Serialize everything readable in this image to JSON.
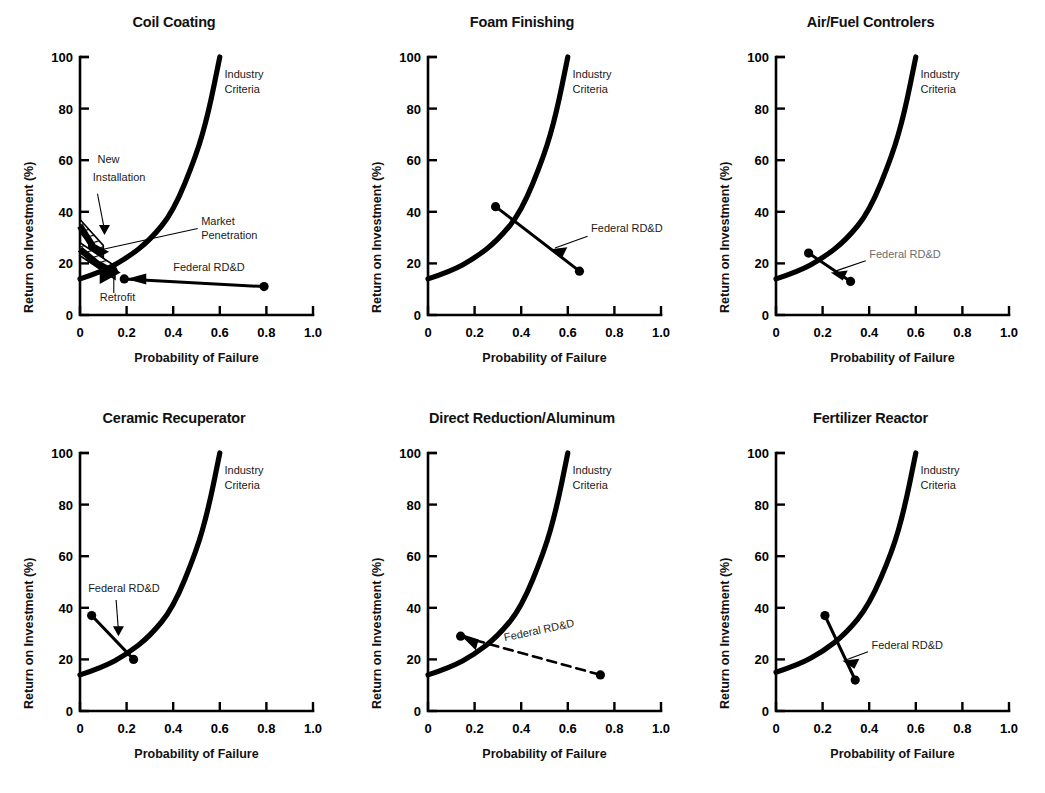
{
  "figure": {
    "axis_labels": {
      "y": "Return on Investment (%)",
      "x": "Probability of Failure"
    },
    "y_ticks": [
      "0",
      "20",
      "40",
      "60",
      "80",
      "100"
    ],
    "x_ticks": [
      "0",
      "0.2",
      "0.4",
      "0.6",
      "0.8",
      "1.0"
    ],
    "series_labels": {
      "industry": "Industry\nCriteria",
      "industry_line1": "Industry",
      "industry_line2": "Criteria",
      "federal": "Federal RD&D",
      "market_line1": "Market",
      "market_line2": "Penetration",
      "new_line1": "New",
      "new_line2": "Installation",
      "retrofit": "Retrofit"
    }
  },
  "chart_data": [
    {
      "type": "line",
      "title": "Coil Coating",
      "xlabel": "Probability of Failure",
      "ylabel": "Return on Investment (%)",
      "xlim": [
        0,
        1.0
      ],
      "ylim": [
        0,
        100
      ],
      "xticks": [
        0,
        0.2,
        0.4,
        0.6,
        0.8,
        1.0
      ],
      "yticks": [
        0,
        20,
        40,
        60,
        80,
        100
      ],
      "grid": false,
      "legend": "none",
      "series": [
        {
          "name": "Industry Criteria",
          "style": "solid-thick",
          "x": [
            0,
            0.1,
            0.2,
            0.3,
            0.4,
            0.5,
            0.55,
            0.6
          ],
          "y": [
            14,
            17,
            22,
            29,
            40,
            62,
            78,
            100
          ]
        },
        {
          "name": "Federal RD&D",
          "style": "solid-arrow-left",
          "x": [
            0.79,
            0.19
          ],
          "y": [
            11,
            14
          ]
        }
      ],
      "annotations": [
        {
          "text": "Industry Criteria",
          "x": 0.64,
          "y": 88
        },
        {
          "text": "New Installation",
          "x": 0.1,
          "y": 56
        },
        {
          "text": "Market Penetration",
          "x": 0.52,
          "y": 33
        },
        {
          "text": "Federal RD&D",
          "x": 0.47,
          "y": 17
        },
        {
          "text": "Retrofit",
          "x": 0.12,
          "y": 7
        }
      ],
      "markers": [
        {
          "x": 0.19,
          "y": 14
        },
        {
          "x": 0.79,
          "y": 11
        }
      ],
      "bands": [
        {
          "name": "New Installation band",
          "style": "hatched-wedge",
          "x0": 0.0,
          "y0": 37,
          "x1": 0.1,
          "y1": 27
        },
        {
          "name": "Retrofit band",
          "style": "hatched-wedge",
          "x0": 0.0,
          "y0": 28,
          "x1": 0.15,
          "y1": 19
        }
      ]
    },
    {
      "type": "line",
      "title": "Foam Finishing",
      "xlabel": "Probability of Failure",
      "ylabel": "Return on Investment (%)",
      "xlim": [
        0,
        1.0
      ],
      "ylim": [
        0,
        100
      ],
      "xticks": [
        0,
        0.2,
        0.4,
        0.6,
        0.8,
        1.0
      ],
      "yticks": [
        0,
        20,
        40,
        60,
        80,
        100
      ],
      "grid": false,
      "legend": "none",
      "series": [
        {
          "name": "Industry Criteria",
          "style": "solid-thick",
          "x": [
            0,
            0.1,
            0.2,
            0.3,
            0.4,
            0.5,
            0.55,
            0.6
          ],
          "y": [
            14,
            17,
            22,
            29,
            40,
            62,
            78,
            100
          ]
        },
        {
          "name": "Federal RD&D",
          "style": "solid",
          "x": [
            0.29,
            0.65
          ],
          "y": [
            42,
            17
          ]
        }
      ],
      "annotations": [
        {
          "text": "Industry Criteria",
          "x": 0.64,
          "y": 88
        },
        {
          "text": "Federal RD&D",
          "x": 0.74,
          "y": 31
        }
      ],
      "markers": [
        {
          "x": 0.29,
          "y": 42
        },
        {
          "x": 0.65,
          "y": 17
        }
      ],
      "bands": []
    },
    {
      "type": "line",
      "title": "Air/Fuel Controlers",
      "xlabel": "Probability of Failure",
      "ylabel": "Return on Investment (%)",
      "xlim": [
        0,
        1.0
      ],
      "ylim": [
        0,
        100
      ],
      "xticks": [
        0,
        0.2,
        0.4,
        0.6,
        0.8,
        1.0
      ],
      "yticks": [
        0,
        20,
        40,
        60,
        80,
        100
      ],
      "grid": false,
      "legend": "none",
      "series": [
        {
          "name": "Industry Criteria",
          "style": "solid-thick",
          "x": [
            0,
            0.1,
            0.2,
            0.3,
            0.4,
            0.5,
            0.55,
            0.6
          ],
          "y": [
            14,
            17,
            22,
            29,
            40,
            62,
            78,
            100
          ]
        },
        {
          "name": "Federal RD&D",
          "style": "solid",
          "x": [
            0.14,
            0.32
          ],
          "y": [
            24,
            13
          ]
        }
      ],
      "annotations": [
        {
          "text": "Industry Criteria",
          "x": 0.64,
          "y": 88
        },
        {
          "text": "Federal RD&D",
          "x": 0.44,
          "y": 21
        }
      ],
      "markers": [
        {
          "x": 0.14,
          "y": 24
        },
        {
          "x": 0.32,
          "y": 13
        }
      ],
      "bands": []
    },
    {
      "type": "line",
      "title": "Ceramic Recuperator",
      "xlabel": "Probability of Failure",
      "ylabel": "Return on Investment (%)",
      "xlim": [
        0,
        1.0
      ],
      "ylim": [
        0,
        100
      ],
      "xticks": [
        0,
        0.2,
        0.4,
        0.6,
        0.8,
        1.0
      ],
      "yticks": [
        0,
        20,
        40,
        60,
        80,
        100
      ],
      "grid": false,
      "legend": "none",
      "series": [
        {
          "name": "Industry Criteria",
          "style": "solid-thick",
          "x": [
            0,
            0.1,
            0.2,
            0.3,
            0.4,
            0.5,
            0.55,
            0.6
          ],
          "y": [
            14,
            17,
            22,
            29,
            40,
            62,
            78,
            100
          ]
        },
        {
          "name": "Federal RD&D",
          "style": "solid",
          "x": [
            0.05,
            0.23
          ],
          "y": [
            37,
            20
          ]
        }
      ],
      "annotations": [
        {
          "text": "Industry Criteria",
          "x": 0.64,
          "y": 88
        },
        {
          "text": "Federal RD&D",
          "x": 0.05,
          "y": 46
        }
      ],
      "markers": [
        {
          "x": 0.05,
          "y": 37
        },
        {
          "x": 0.23,
          "y": 20
        }
      ],
      "bands": []
    },
    {
      "type": "line",
      "title": "Direct Reduction/Aluminum",
      "xlabel": "Probability of Failure",
      "ylabel": "Return on Investment (%)",
      "xlim": [
        0,
        1.0
      ],
      "ylim": [
        0,
        100
      ],
      "xticks": [
        0,
        0.2,
        0.4,
        0.6,
        0.8,
        1.0
      ],
      "yticks": [
        0,
        20,
        40,
        60,
        80,
        100
      ],
      "grid": false,
      "legend": "none",
      "series": [
        {
          "name": "Industry Criteria",
          "style": "solid-thick",
          "x": [
            0,
            0.1,
            0.2,
            0.3,
            0.4,
            0.5,
            0.55,
            0.6
          ],
          "y": [
            14,
            17,
            22,
            29,
            40,
            62,
            78,
            100
          ]
        },
        {
          "name": "Federal RD&D",
          "style": "dashed",
          "x": [
            0.14,
            0.74
          ],
          "y": [
            29,
            14
          ]
        }
      ],
      "annotations": [
        {
          "text": "Industry Criteria",
          "x": 0.64,
          "y": 88
        },
        {
          "text": "Federal RD&D",
          "x": 0.44,
          "y": 26
        }
      ],
      "markers": [
        {
          "x": 0.14,
          "y": 29
        },
        {
          "x": 0.74,
          "y": 14
        }
      ],
      "bands": []
    },
    {
      "type": "line",
      "title": "Fertilizer Reactor",
      "xlabel": "Probability of Failure",
      "ylabel": "Return on Investment (%)",
      "xlim": [
        0,
        1.0
      ],
      "ylim": [
        0,
        100
      ],
      "xticks": [
        0,
        0.2,
        0.4,
        0.6,
        0.8,
        1.0
      ],
      "yticks": [
        0,
        20,
        40,
        60,
        80,
        100
      ],
      "grid": false,
      "legend": "none",
      "series": [
        {
          "name": "Industry Criteria",
          "style": "solid-thick",
          "x": [
            0,
            0.1,
            0.2,
            0.3,
            0.4,
            0.5,
            0.55,
            0.6
          ],
          "y": [
            15,
            18,
            23,
            30,
            41,
            62,
            78,
            100
          ]
        },
        {
          "name": "Federal RD&D",
          "style": "solid",
          "x": [
            0.21,
            0.34
          ],
          "y": [
            37,
            12
          ]
        }
      ],
      "annotations": [
        {
          "text": "Industry Criteria",
          "x": 0.64,
          "y": 88
        },
        {
          "text": "Federal RD&D",
          "x": 0.45,
          "y": 24
        }
      ],
      "markers": [
        {
          "x": 0.21,
          "y": 37
        },
        {
          "x": 0.34,
          "y": 12
        }
      ],
      "bands": []
    }
  ],
  "colors": {
    "ink": "#000000",
    "faded_ink": "#6d6d6d",
    "background": "#ffffff"
  }
}
